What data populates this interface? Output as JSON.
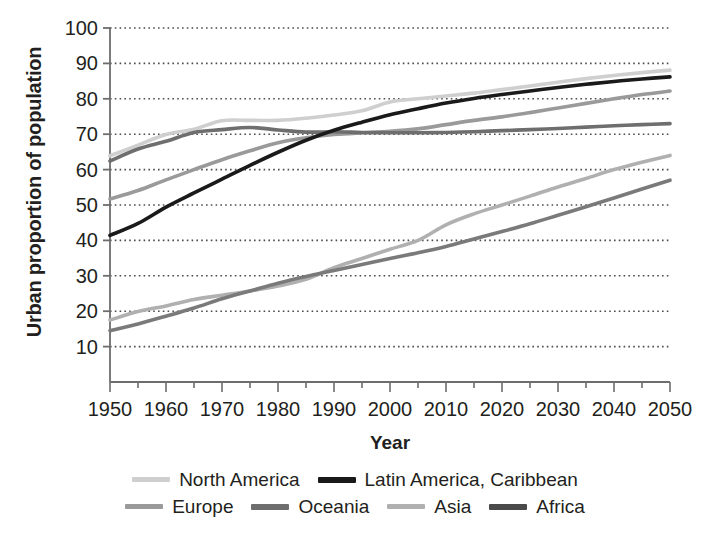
{
  "chart_data": {
    "type": "line",
    "title": "",
    "xlabel": "Year",
    "ylabel": "Urban proportion of population",
    "xlim": [
      1950,
      2050
    ],
    "ylim": [
      0,
      100
    ],
    "xticks": [
      1950,
      1960,
      1970,
      1980,
      1990,
      2000,
      2010,
      2020,
      2030,
      2040,
      2050
    ],
    "xtick_labels": [
      "1950",
      "1960",
      "1970",
      "1980",
      "1990",
      "2000",
      "2010",
      "2020",
      "2030",
      "2040",
      "2050"
    ],
    "x_minor_tick_interval": 5,
    "yticks": [
      10,
      20,
      30,
      40,
      50,
      60,
      70,
      80,
      90,
      100
    ],
    "ytick_labels": [
      "10",
      "20",
      "30",
      "40",
      "50",
      "60",
      "70",
      "80",
      "90",
      "100"
    ],
    "grid": "horizontal-dotted",
    "legend_position": "bottom",
    "x": [
      1950,
      1955,
      1960,
      1965,
      1970,
      1975,
      1980,
      1985,
      1990,
      1995,
      2000,
      2005,
      2010,
      2015,
      2020,
      2025,
      2030,
      2035,
      2040,
      2045,
      2050
    ],
    "series": [
      {
        "name": "North America",
        "color": "#cfcfcf",
        "values": [
          63.9,
          66.9,
          69.9,
          71.4,
          73.8,
          73.9,
          73.9,
          74.5,
          75.4,
          76.6,
          79.1,
          80.0,
          80.8,
          81.6,
          82.6,
          83.6,
          84.7,
          85.7,
          86.6,
          87.4,
          88.1
        ]
      },
      {
        "name": "Latin America, Caribbean",
        "color": "#1a1a1a",
        "values": [
          41.4,
          44.8,
          49.4,
          53.4,
          57.3,
          61.2,
          64.9,
          68.3,
          71.1,
          73.4,
          75.5,
          77.2,
          78.8,
          80.1,
          81.2,
          82.2,
          83.2,
          84.1,
          84.9,
          85.6,
          86.2
        ]
      },
      {
        "name": "Europe",
        "color": "#9a9a9a",
        "values": [
          51.7,
          54.1,
          57.1,
          60.0,
          62.8,
          65.3,
          67.6,
          69.0,
          69.9,
          70.4,
          70.8,
          71.5,
          72.7,
          73.9,
          74.9,
          76.1,
          77.4,
          78.7,
          80.0,
          81.2,
          82.2
        ]
      },
      {
        "name": "Oceania",
        "color": "#6e6e6e",
        "values": [
          62.4,
          65.8,
          68.0,
          70.5,
          71.3,
          71.9,
          71.2,
          70.6,
          70.7,
          70.5,
          70.4,
          70.4,
          70.5,
          70.7,
          71.0,
          71.3,
          71.6,
          72.0,
          72.4,
          72.7,
          73.0
        ]
      },
      {
        "name": "Asia",
        "color": "#b0b0b0",
        "values": [
          17.5,
          19.9,
          21.5,
          23.3,
          24.5,
          25.7,
          27.1,
          29.0,
          32.3,
          34.9,
          37.5,
          40.0,
          44.4,
          47.5,
          50.0,
          52.5,
          55.1,
          57.5,
          60.0,
          62.1,
          64.0
        ]
      },
      {
        "name": "Africa",
        "color": "#7a7a7a",
        "values": [
          14.5,
          16.4,
          18.6,
          20.9,
          23.5,
          25.7,
          27.9,
          29.8,
          31.5,
          33.2,
          34.9,
          36.5,
          38.3,
          40.4,
          42.5,
          44.7,
          47.1,
          49.5,
          52.0,
          54.5,
          57.0
        ]
      }
    ]
  },
  "legend": {
    "rows": [
      [
        {
          "label": "North America",
          "color": "#cfcfcf",
          "thickness": 5
        },
        {
          "label": "Latin America, Caribbean",
          "color": "#1a1a1a",
          "thickness": 6
        }
      ],
      [
        {
          "label": "Europe",
          "color": "#9a9a9a",
          "thickness": 5
        },
        {
          "label": "Oceania",
          "color": "#6e6e6e",
          "thickness": 6
        },
        {
          "label": "Asia",
          "color": "#b0b0b0",
          "thickness": 5
        },
        {
          "label": "Africa",
          "color": "#4a4a4a",
          "thickness": 6
        }
      ]
    ]
  },
  "axes": {
    "frame_color": "#6d6d6d",
    "grid_color": "#4d4d4d"
  }
}
